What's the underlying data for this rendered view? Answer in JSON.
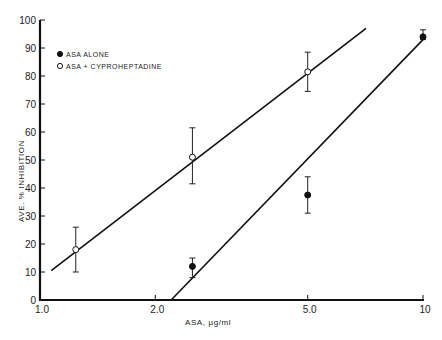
{
  "chart_data": {
    "type": "scatter",
    "title": "",
    "xlabel": "ASA, µg/ml",
    "ylabel": "AVE. % INHIBITION",
    "xscale": "log",
    "xlim": [
      1.0,
      10
    ],
    "ylim": [
      0,
      100
    ],
    "x_ticks": [
      {
        "value": 1.0,
        "label": "1.0"
      },
      {
        "value": 2.0,
        "label": "2.0"
      },
      {
        "value": 5.0,
        "label": "5.0"
      },
      {
        "value": 10,
        "label": "10"
      }
    ],
    "y_ticks": [
      0,
      10,
      20,
      30,
      40,
      50,
      60,
      70,
      80,
      90,
      100
    ],
    "grid": false,
    "legend_position": "top-left",
    "series": [
      {
        "name": "ASA ALONE",
        "marker": "filled-circle",
        "points": [
          {
            "x": 2.5,
            "y": 12,
            "err_low": 8,
            "err_high": 15
          },
          {
            "x": 5.0,
            "y": 37.5,
            "err_low": 31,
            "err_high": 44
          },
          {
            "x": 10,
            "y": 94,
            "err_low": 93,
            "err_high": 96.5
          }
        ],
        "fit_line": {
          "x": [
            2.2,
            10
          ],
          "y": [
            0,
            93
          ]
        }
      },
      {
        "name": "ASA + CYPROHEPTADINE",
        "marker": "open-circle",
        "points": [
          {
            "x": 1.24,
            "y": 18,
            "err_low": 10,
            "err_high": 26
          },
          {
            "x": 2.5,
            "y": 51,
            "err_low": 41.5,
            "err_high": 61.5
          },
          {
            "x": 5.0,
            "y": 81.5,
            "err_low": 74.5,
            "err_high": 88.5
          }
        ],
        "fit_line": {
          "x": [
            1.07,
            7.1
          ],
          "y": [
            10.5,
            97
          ]
        }
      }
    ]
  }
}
